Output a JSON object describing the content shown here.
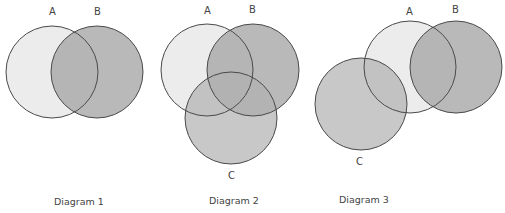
{
  "diagrams": [
    {
      "caption": "Diagram 1",
      "sets": [
        {
          "label": "A",
          "cx": 52,
          "cy": 72,
          "r": 46
        },
        {
          "label": "B",
          "cx": 97,
          "cy": 72,
          "r": 46
        }
      ]
    },
    {
      "caption": "Diagram 2",
      "sets": [
        {
          "label": "A",
          "cx": 207,
          "cy": 70,
          "r": 46
        },
        {
          "label": "B",
          "cx": 253,
          "cy": 70,
          "r": 46
        },
        {
          "label": "C",
          "cx": 231,
          "cy": 118,
          "r": 46
        }
      ]
    },
    {
      "caption": "Diagram 3",
      "sets": [
        {
          "label": "A",
          "cx": 410,
          "cy": 67,
          "r": 46
        },
        {
          "label": "B",
          "cx": 456,
          "cy": 67,
          "r": 46
        },
        {
          "label": "C",
          "cx": 361,
          "cy": 104,
          "r": 46
        }
      ]
    }
  ],
  "colors": {
    "set_a": "#ececec",
    "set_b": "#b8b8b8",
    "set_c": "#c6c6c6",
    "stroke": "#4a4a4a"
  }
}
